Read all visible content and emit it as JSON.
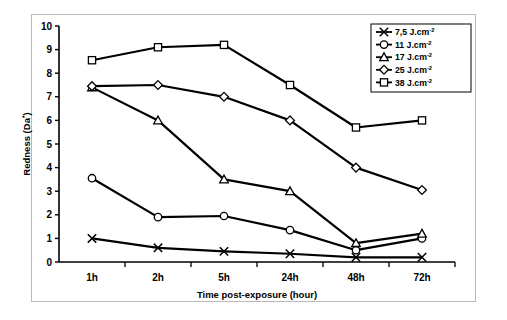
{
  "chart_data": {
    "type": "line",
    "title": "",
    "xlabel": "Time post-exposure (hour)",
    "ylabel": "Redness (Da*)",
    "categories": [
      "1h",
      "2h",
      "5h",
      "24h",
      "48h",
      "72h"
    ],
    "ylim": [
      0,
      10
    ],
    "yticks": [
      "0",
      "1",
      "2",
      "3",
      "4",
      "5",
      "6",
      "7",
      "8",
      "9",
      "10"
    ],
    "grid": false,
    "legend_position": "top-right",
    "series": [
      {
        "name": "7,5 J.cm-2",
        "marker": "x",
        "values": [
          1.0,
          0.6,
          0.45,
          0.35,
          0.2,
          0.2
        ]
      },
      {
        "name": "11 J.cm-2",
        "marker": "circle",
        "values": [
          3.55,
          1.9,
          1.95,
          1.35,
          0.5,
          1.0
        ]
      },
      {
        "name": "17 J.cm-2",
        "marker": "triangle",
        "values": [
          7.4,
          6.0,
          3.5,
          3.0,
          0.8,
          1.2
        ]
      },
      {
        "name": "25 J.cm-2",
        "marker": "diamond",
        "values": [
          7.45,
          7.5,
          7.0,
          6.0,
          4.0,
          3.05
        ]
      },
      {
        "name": "38 J.cm-2",
        "marker": "square",
        "values": [
          8.55,
          9.1,
          9.2,
          7.5,
          5.7,
          6.0
        ]
      }
    ]
  },
  "legend": {
    "entries": [
      {
        "label": "7,5 J.cm",
        "exponent": "-2"
      },
      {
        "label": "11 J.cm",
        "exponent": "-2"
      },
      {
        "label": "17 J.cm",
        "exponent": "-2"
      },
      {
        "label": "25 J.cm",
        "exponent": "-2"
      },
      {
        "label": "38 J.cm",
        "exponent": "-2"
      }
    ]
  },
  "axes": {
    "y_title_main": "Redness (Da",
    "y_title_sup": "*",
    "y_title_end": ")",
    "x_title": "Time post-exposure (hour)"
  },
  "colors": {
    "line": "#000000",
    "marker_fill": "#ffffff",
    "frame": "#b9b9b9",
    "background": "#ffffff"
  }
}
